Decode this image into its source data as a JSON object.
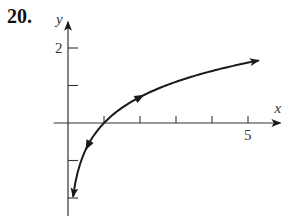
{
  "problem": {
    "number": "20."
  },
  "chart_data": {
    "type": "line",
    "title": "",
    "function": "y = ln(x)",
    "xlabel": "x",
    "ylabel": "y",
    "xlim": [
      -0.4,
      5.9
    ],
    "ylim": [
      -2.5,
      2.7
    ],
    "x_ticks": [
      1,
      2,
      3,
      4,
      5
    ],
    "x_tick_labels": {
      "5": "5"
    },
    "y_ticks": [
      -2,
      -1,
      1,
      2
    ],
    "y_tick_labels": {
      "2": "2"
    },
    "grid": false,
    "legend": null,
    "series": [
      {
        "name": "curve",
        "x": [
          0.14,
          0.25,
          0.4,
          0.55,
          0.75,
          1,
          1.5,
          2,
          2.5,
          3,
          3.5,
          4,
          4.5,
          5,
          5.3
        ],
        "y": [
          -1.97,
          -1.39,
          -0.92,
          -0.6,
          -0.29,
          0,
          0.41,
          0.69,
          0.92,
          1.1,
          1.25,
          1.39,
          1.5,
          1.61,
          1.67
        ]
      }
    ],
    "annotations": {
      "arrow_ends": [
        [
          0.14,
          -1.97
        ],
        [
          5.3,
          1.67
        ]
      ],
      "direction_arrows": [
        [
          0.55,
          -0.6
        ],
        [
          2,
          0.69
        ]
      ]
    },
    "color": "#1a1a1a"
  }
}
